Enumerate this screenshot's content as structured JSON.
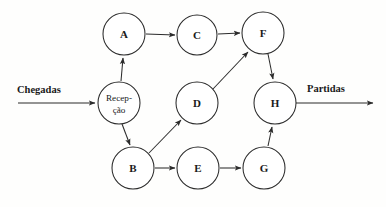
{
  "diagram": {
    "type": "flow-network",
    "title_visible": false,
    "background_color": "#fefefd",
    "stroke_color": "#2b2b2b",
    "text_color": "#1a1a1a",
    "nodes": [
      {
        "id": "reception",
        "label_line1": "Recep-",
        "label_line2": "ção",
        "cx": 119,
        "cy": 103,
        "r": 21,
        "multiline": true
      },
      {
        "id": "A",
        "label": "A",
        "cx": 124,
        "cy": 34,
        "r": 21
      },
      {
        "id": "C",
        "label": "C",
        "cx": 197,
        "cy": 35,
        "r": 20
      },
      {
        "id": "F",
        "label": "F",
        "cx": 263,
        "cy": 33,
        "r": 21
      },
      {
        "id": "D",
        "label": "D",
        "cx": 197,
        "cy": 103,
        "r": 21
      },
      {
        "id": "H",
        "label": "H",
        "cx": 275,
        "cy": 103,
        "r": 21
      },
      {
        "id": "B",
        "label": "B",
        "cx": 133,
        "cy": 168,
        "r": 21
      },
      {
        "id": "E",
        "label": "E",
        "cx": 198,
        "cy": 168,
        "r": 21
      },
      {
        "id": "G",
        "label": "G",
        "cx": 264,
        "cy": 168,
        "r": 21
      }
    ],
    "edges": [
      {
        "from": "arrivals",
        "to": "reception",
        "kind": "external-in"
      },
      {
        "from": "reception",
        "to": "A",
        "kind": "internal"
      },
      {
        "from": "reception",
        "to": "B",
        "kind": "internal"
      },
      {
        "from": "A",
        "to": "C",
        "kind": "internal"
      },
      {
        "from": "C",
        "to": "F",
        "kind": "internal"
      },
      {
        "from": "B",
        "to": "D",
        "kind": "internal"
      },
      {
        "from": "B",
        "to": "E",
        "kind": "internal"
      },
      {
        "from": "D",
        "to": "F",
        "kind": "internal"
      },
      {
        "from": "E",
        "to": "G",
        "kind": "internal"
      },
      {
        "from": "G",
        "to": "H",
        "kind": "internal"
      },
      {
        "from": "F",
        "to": "H",
        "kind": "internal"
      },
      {
        "from": "H",
        "to": "departures",
        "kind": "external-out"
      }
    ],
    "io_labels": {
      "arrivals": "Chegadas",
      "departures": "Partidas"
    }
  }
}
